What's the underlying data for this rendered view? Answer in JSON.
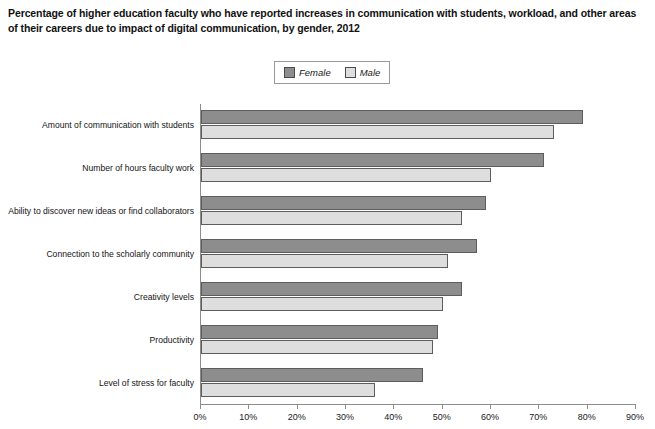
{
  "title": "Percentage of higher education faculty who have reported increases in communication with students, workload, and other areas of their careers due to impact of digital communication, by gender, 2012",
  "legend": {
    "items": [
      {
        "label": "Female",
        "color": "#8d8d8d"
      },
      {
        "label": "Male",
        "color": "#dedede"
      }
    ]
  },
  "chart_data": {
    "type": "bar",
    "orientation": "horizontal",
    "title": "Percentage of higher education faculty who have reported increases in communication with students, workload, and other areas of their careers due to impact of digital communication, by gender, 2012",
    "xlabel": "",
    "ylabel": "",
    "xlim": [
      0,
      90
    ],
    "xticks": [
      0,
      10,
      20,
      30,
      40,
      50,
      60,
      70,
      80,
      90
    ],
    "xtick_labels": [
      "0%",
      "10%",
      "20%",
      "30%",
      "40%",
      "50%",
      "60%",
      "70%",
      "80%",
      "90%"
    ],
    "grid": false,
    "legend_position": "top-center",
    "categories": [
      "Amount of communication with students",
      "Number of hours faculty work",
      "Ability to discover new ideas or find collaborators",
      "Connection to the scholarly community",
      "Creativity levels",
      "Productivity",
      "Level of stress for faculty"
    ],
    "series": [
      {
        "name": "Female",
        "color": "#8d8d8d",
        "values": [
          79,
          71,
          59,
          57,
          54,
          49,
          46
        ]
      },
      {
        "name": "Male",
        "color": "#dedede",
        "values": [
          73,
          60,
          54,
          51,
          50,
          48,
          36
        ]
      }
    ]
  }
}
